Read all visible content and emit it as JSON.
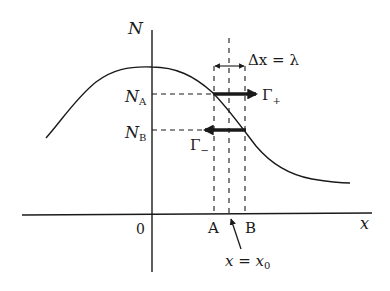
{
  "diagram": {
    "axes": {
      "y_label": "N",
      "x_label": "x",
      "origin_label": "0"
    },
    "levels": {
      "na_main": "N",
      "na_sub": "A",
      "nb_main": "N",
      "nb_sub": "B"
    },
    "points": {
      "a_label": "A",
      "b_label": "B",
      "x0_main": "x = x",
      "x0_sub": "0"
    },
    "interval": {
      "label": "Δx = λ"
    },
    "fluxes": {
      "plus_main": "Γ",
      "plus_sub": "+",
      "minus_main": "Γ",
      "minus_sub": "−"
    },
    "colors": {
      "ink": "#1a1a1a",
      "background": "#ffffff"
    }
  }
}
